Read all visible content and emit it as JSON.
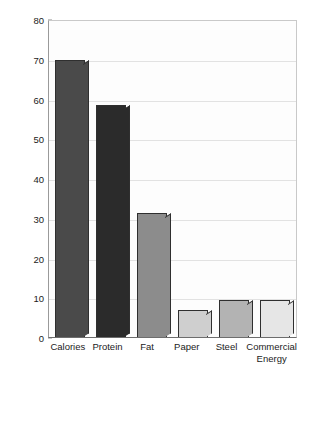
{
  "chart_data": {
    "type": "bar",
    "title": "",
    "subtitle": "",
    "xlabel": "",
    "ylabel": "Per capita consumption in poor nations, compared to wealthy nations, %",
    "ylim": [
      0,
      80
    ],
    "yticks": [
      0,
      10,
      20,
      30,
      40,
      50,
      60,
      70,
      80
    ],
    "ytick_labels": [
      "0",
      "10",
      "20",
      "30",
      "40",
      "50",
      "60",
      "70",
      "80"
    ],
    "grid": "horizontal",
    "legend": "none",
    "categories": [
      "Calories",
      "Protein",
      "Fat",
      "Paper",
      "Steel",
      "Commercial Energy"
    ],
    "category_label_lines": [
      [
        "Calories"
      ],
      [
        "Protein"
      ],
      [
        "Fat"
      ],
      [
        "Paper"
      ],
      [
        "Steel"
      ],
      [
        "Commercial",
        "Energy"
      ]
    ],
    "values": [
      69.8,
      58.3,
      31.2,
      6.7,
      9.4,
      9.2
    ],
    "bar_colors": [
      "#4a4a4a",
      "#2b2b2b",
      "#8c8c8c",
      "#cfcfcf",
      "#b3b3b3",
      "#e6e6e6"
    ],
    "bar_edge_color": "#2f2f2f",
    "plot_background": "#fdfdfd",
    "gridline_color": "#e2e2e2",
    "axis_color": "#6d6d6d",
    "text_color": "#1b1b1b"
  }
}
